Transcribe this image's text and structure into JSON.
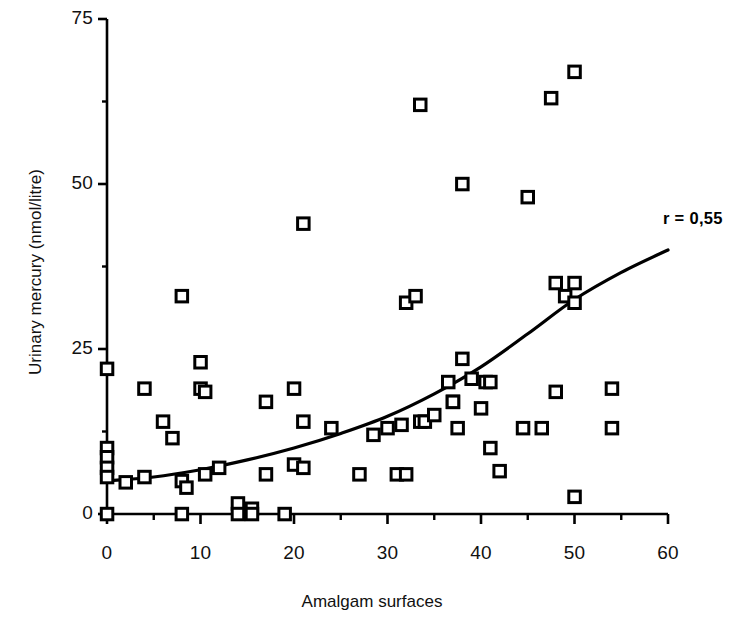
{
  "chart_data": {
    "type": "scatter",
    "title": "",
    "xlabel": "Amalgam surfaces",
    "ylabel": "Urinary mercury (nmol/litre)",
    "xlim": [
      0,
      60
    ],
    "ylim": [
      0,
      75
    ],
    "xticks": [
      0,
      10,
      20,
      30,
      40,
      50,
      60
    ],
    "xtick_labels": [
      "0",
      "10",
      "20",
      "30",
      "40",
      "50",
      "60"
    ],
    "x_minor_ticks": [
      5,
      15,
      25,
      35,
      45,
      55
    ],
    "yticks": [
      0,
      25,
      50,
      75
    ],
    "ytick_labels": [
      "0",
      "25",
      "50",
      "75"
    ],
    "y_minor_ticks": [
      12.5,
      37.5,
      62.5
    ],
    "grid": false,
    "legend": null,
    "marker": "open-square",
    "annotations": [
      {
        "text": "r = 0,55",
        "x": 58.5,
        "y": 41.5,
        "bold": true
      }
    ],
    "series": [
      {
        "name": "Subjects",
        "type": "scatter",
        "points": [
          [
            0,
            22
          ],
          [
            0,
            10
          ],
          [
            0,
            8.6
          ],
          [
            0,
            7
          ],
          [
            0,
            5.6
          ],
          [
            0,
            0
          ],
          [
            2,
            4.8
          ],
          [
            4,
            19
          ],
          [
            4,
            5.6
          ],
          [
            6,
            14
          ],
          [
            7,
            11.5
          ],
          [
            8,
            33
          ],
          [
            8,
            5
          ],
          [
            8.5,
            4
          ],
          [
            8,
            0
          ],
          [
            10,
            23
          ],
          [
            10,
            19
          ],
          [
            10.5,
            18.5
          ],
          [
            10.5,
            6
          ],
          [
            12,
            7
          ],
          [
            14,
            1.6
          ],
          [
            14,
            0
          ],
          [
            15.5,
            0.8
          ],
          [
            15.5,
            0
          ],
          [
            17,
            17
          ],
          [
            17,
            6
          ],
          [
            19,
            0
          ],
          [
            20,
            19
          ],
          [
            20,
            7.5
          ],
          [
            21,
            44
          ],
          [
            21,
            14
          ],
          [
            21,
            7
          ],
          [
            24,
            13
          ],
          [
            27,
            6
          ],
          [
            28.5,
            12
          ],
          [
            30,
            13
          ],
          [
            31,
            6
          ],
          [
            31.5,
            13.5
          ],
          [
            32,
            32
          ],
          [
            32,
            6
          ],
          [
            33,
            33
          ],
          [
            33.5,
            62
          ],
          [
            33.5,
            14
          ],
          [
            34,
            14
          ],
          [
            35,
            15
          ],
          [
            36.5,
            20
          ],
          [
            37,
            17
          ],
          [
            37,
            17
          ],
          [
            37.5,
            13
          ],
          [
            38,
            50
          ],
          [
            38,
            23.5
          ],
          [
            39,
            20.5
          ],
          [
            40,
            16
          ],
          [
            40.5,
            20
          ],
          [
            41,
            20
          ],
          [
            41,
            10
          ],
          [
            42,
            6.5
          ],
          [
            44.5,
            13
          ],
          [
            45,
            48
          ],
          [
            46.5,
            13
          ],
          [
            47.5,
            63
          ],
          [
            48,
            35
          ],
          [
            48,
            18.5
          ],
          [
            49,
            33
          ],
          [
            50,
            67
          ],
          [
            50,
            35
          ],
          [
            50,
            32
          ],
          [
            50,
            2.6
          ],
          [
            54,
            19
          ],
          [
            54,
            13
          ]
        ]
      },
      {
        "name": "Regression curve",
        "type": "line",
        "points": [
          [
            0,
            5.0
          ],
          [
            5,
            5.6
          ],
          [
            10,
            6.7
          ],
          [
            15,
            8.2
          ],
          [
            20,
            10.0
          ],
          [
            25,
            12.2
          ],
          [
            30,
            14.8
          ],
          [
            35,
            18.2
          ],
          [
            40,
            22.3
          ],
          [
            45,
            27.3
          ],
          [
            50,
            32.5
          ],
          [
            55,
            36.6
          ],
          [
            60,
            40.0
          ]
        ]
      }
    ]
  }
}
